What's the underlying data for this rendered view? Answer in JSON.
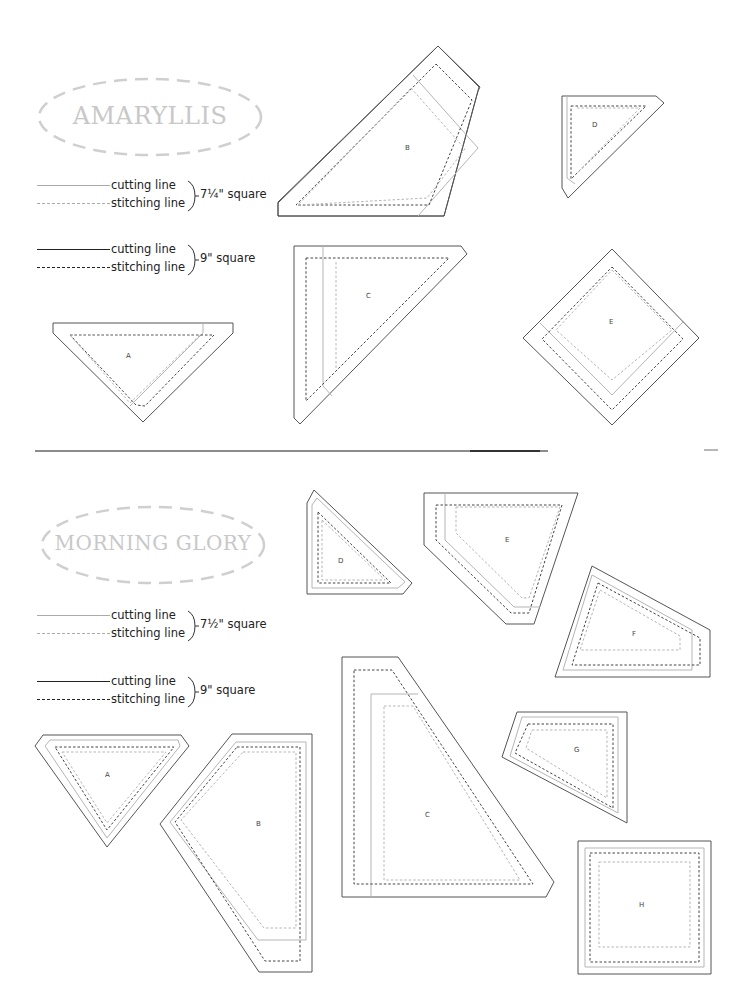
{
  "sections": [
    {
      "id": "amaryllis",
      "title": "AMARYLLIS",
      "legends": [
        {
          "cutting_label": "cutting line",
          "stitching_label": "stitching line",
          "size_label": "7¼\" square",
          "style": "light"
        },
        {
          "cutting_label": "cutting line",
          "stitching_label": "stitching line",
          "size_label": "9\" square",
          "style": "dark"
        }
      ],
      "pieces": [
        {
          "label": "A"
        },
        {
          "label": "B"
        },
        {
          "label": "C"
        },
        {
          "label": "D"
        },
        {
          "label": "E"
        }
      ]
    },
    {
      "id": "morning-glory",
      "title": "MORNING GLORY",
      "legends": [
        {
          "cutting_label": "cutting line",
          "stitching_label": "stitching line",
          "size_label": "7½\" square",
          "style": "light"
        },
        {
          "cutting_label": "cutting line",
          "stitching_label": "stitching line",
          "size_label": "9\" square",
          "style": "dark"
        }
      ],
      "pieces": [
        {
          "label": "A"
        },
        {
          "label": "B"
        },
        {
          "label": "C"
        },
        {
          "label": "D"
        },
        {
          "label": "E"
        },
        {
          "label": "F"
        },
        {
          "label": "G"
        },
        {
          "label": "H"
        }
      ]
    }
  ],
  "colors": {
    "dark_line": "#555555",
    "light_line": "#b0b0b0",
    "badge_text": "#c8c8c8",
    "badge_border": "#cccccc",
    "divider": "#666666"
  }
}
